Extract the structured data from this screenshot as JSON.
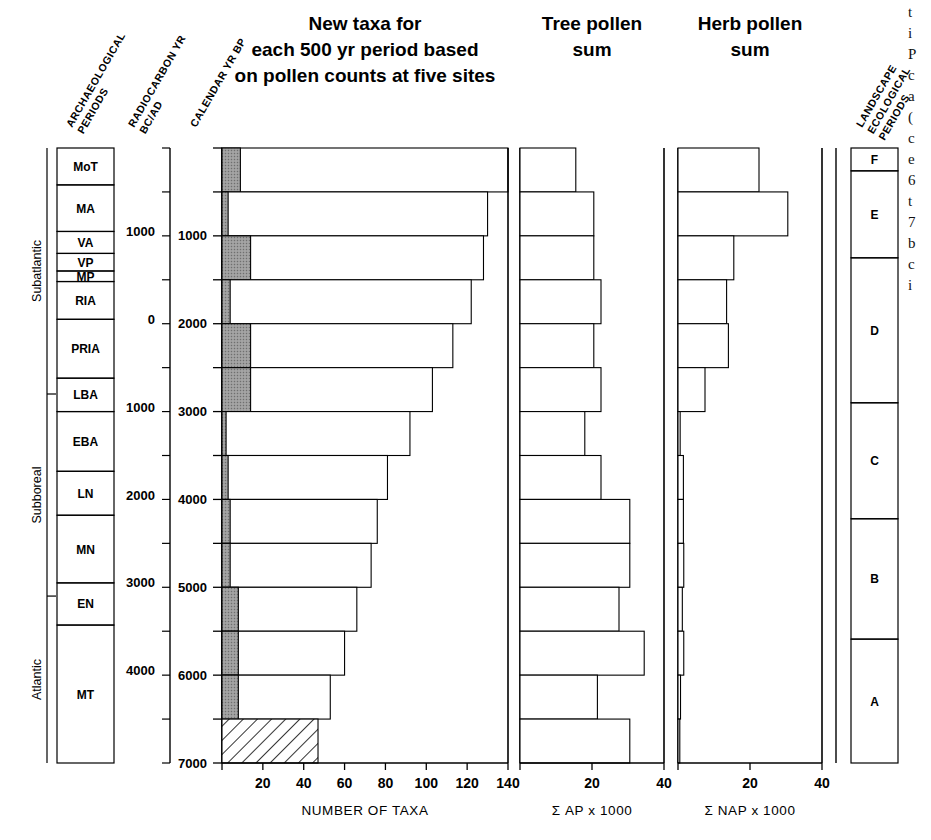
{
  "figure": {
    "titles": {
      "main": [
        "New taxa for",
        "each 500 yr period based",
        "on pollen counts at five sites"
      ],
      "tree": [
        "Tree pollen",
        "sum"
      ],
      "herb": [
        "Herb pollen",
        "sum"
      ]
    },
    "column_headers": {
      "archaeological": [
        "ARCHAEOLOGICAL",
        "PERIODS"
      ],
      "radiocarbon": [
        "RADIOCARBON YR",
        "BC/AD"
      ],
      "calendar": [
        "CALENDAR YR BP"
      ],
      "landscape": [
        "LANDSCAPE",
        "ECOLOGICAL",
        "PERIODS"
      ]
    },
    "axis_labels": {
      "taxa": "NUMBER OF TAXA",
      "tree": "Σ AP x 1000",
      "herb": "Σ NAP x 1000"
    }
  },
  "chronozones": [
    {
      "label": "Subatlantic",
      "bp_start": 0,
      "bp_end": 2800
    },
    {
      "label": "Subboreal",
      "bp_start": 2800,
      "bp_end": 5100
    },
    {
      "label": "Atlantic",
      "bp_start": 5100,
      "bp_end": 7000
    }
  ],
  "archaeological_periods": [
    {
      "label": "MoT",
      "bp_start": 0,
      "bp_end": 420
    },
    {
      "label": "MA",
      "bp_start": 420,
      "bp_end": 950
    },
    {
      "label": "VA",
      "bp_start": 950,
      "bp_end": 1200
    },
    {
      "label": "VP",
      "bp_start": 1200,
      "bp_end": 1400
    },
    {
      "label": "MP",
      "bp_start": 1400,
      "bp_end": 1520
    },
    {
      "label": "RIA",
      "bp_start": 1520,
      "bp_end": 1950
    },
    {
      "label": "PRIA",
      "bp_start": 1950,
      "bp_end": 2620
    },
    {
      "label": "LBA",
      "bp_start": 2620,
      "bp_end": 3000
    },
    {
      "label": "EBA",
      "bp_start": 3000,
      "bp_end": 3680
    },
    {
      "label": "LN",
      "bp_start": 3680,
      "bp_end": 4180
    },
    {
      "label": "MN",
      "bp_start": 4180,
      "bp_end": 4950
    },
    {
      "label": "EN",
      "bp_start": 4950,
      "bp_end": 5430
    },
    {
      "label": "MT",
      "bp_start": 5430,
      "bp_end": 7000
    }
  ],
  "landscape_periods": [
    {
      "label": "F",
      "bp_start": 0,
      "bp_end": 260
    },
    {
      "label": "E",
      "bp_start": 260,
      "bp_end": 1250
    },
    {
      "label": "D",
      "bp_start": 1250,
      "bp_end": 2900
    },
    {
      "label": "C",
      "bp_start": 2900,
      "bp_end": 4220
    },
    {
      "label": "B",
      "bp_start": 4220,
      "bp_end": 5590
    },
    {
      "label": "A",
      "bp_start": 5590,
      "bp_end": 7000
    }
  ],
  "calendar_axis": {
    "label": "CALENDAR YR BP",
    "ticks": [
      0,
      500,
      1000,
      1500,
      2000,
      2500,
      3000,
      3500,
      4000,
      4500,
      5000,
      5500,
      6000,
      6500,
      7000
    ],
    "labeled_ticks": [
      1000,
      2000,
      3000,
      4000,
      5000,
      6000,
      7000
    ],
    "min": 0,
    "max": 7000
  },
  "radiocarbon_axis": {
    "label": "RADIOCARBON YR BC/AD",
    "labeled": [
      {
        "text": "1000",
        "bp": 950
      },
      {
        "text": "0",
        "bp": 1950
      },
      {
        "text": "1000",
        "bp": 2950
      },
      {
        "text": "2000",
        "bp": 3950
      },
      {
        "text": "3000",
        "bp": 4950
      },
      {
        "text": "4000",
        "bp": 5950
      }
    ]
  },
  "chart_data": [
    {
      "type": "bar",
      "title": "New taxa for each 500 yr period based on pollen counts at five sites",
      "xlabel": "NUMBER OF TAXA",
      "ylabel": "CALENDAR YR BP",
      "orientation": "horizontal",
      "xlim": [
        0,
        140
      ],
      "xticks": [
        0,
        20,
        40,
        60,
        80,
        100,
        120,
        140
      ],
      "ylim": [
        0,
        7000
      ],
      "grid": false,
      "categories": [
        "0-500",
        "500-1000",
        "1000-1500",
        "1500-2000",
        "2000-2500",
        "2500-3000",
        "3000-3500",
        "3500-4000",
        "4000-4500",
        "4500-5000",
        "5000-5500",
        "5500-6000",
        "6000-6500",
        "6500-7000"
      ],
      "series": [
        {
          "name": "new taxa total",
          "values": [
            140,
            130,
            128,
            122,
            113,
            103,
            92,
            81,
            76,
            73,
            66,
            60,
            53,
            47
          ]
        },
        {
          "name": "shaded portion",
          "values": [
            9,
            3,
            14,
            4,
            14,
            14,
            2,
            3,
            4,
            4,
            8,
            8,
            8,
            0
          ]
        }
      ],
      "hatched_bar_index": 13,
      "notes": "lowest bar (6500-7000 BP) drawn with diagonal hatching"
    },
    {
      "type": "bar",
      "title": "Tree pollen sum",
      "xlabel": "Σ AP x 1000",
      "orientation": "horizontal",
      "xlim": [
        0,
        40
      ],
      "xticks": [
        0,
        20,
        40
      ],
      "grid": false,
      "categories": [
        "0-500",
        "500-1000",
        "1000-1500",
        "1500-2000",
        "2000-2500",
        "2500-3000",
        "3000-3500",
        "3500-4000",
        "4000-4500",
        "4500-5000",
        "5000-5500",
        "5500-6000",
        "6000-6500",
        "6500-7000"
      ],
      "values": [
        15.5,
        20.5,
        20.5,
        22.5,
        20.5,
        22.5,
        18.0,
        22.5,
        30.5,
        30.5,
        27.5,
        34.5,
        21.5,
        30.5
      ]
    },
    {
      "type": "bar",
      "title": "Herb pollen sum",
      "xlabel": "Σ NAP x 1000",
      "orientation": "horizontal",
      "xlim": [
        0,
        40
      ],
      "xticks": [
        0,
        20,
        40
      ],
      "grid": false,
      "categories": [
        "0-500",
        "500-1000",
        "1000-1500",
        "1500-2000",
        "2000-2500",
        "2500-3000",
        "3000-3500",
        "3500-4000",
        "4000-4500",
        "4500-5000",
        "5000-5500",
        "5500-6000",
        "6000-6500",
        "6500-7000"
      ],
      "values": [
        22.5,
        30.5,
        15.5,
        13.5,
        14.0,
        7.5,
        0.6,
        1.5,
        1.5,
        1.6,
        1.2,
        1.6,
        0.7,
        0.5
      ]
    }
  ],
  "caption_fragment": [
    "t",
    "i",
    "P",
    "c",
    "a",
    "(",
    "c",
    "e",
    "6",
    "t",
    "7",
    "b",
    "c",
    "i"
  ],
  "colors": {
    "shaded_fill": "#8f8f8f",
    "bar_stroke": "#000000",
    "background": "#ffffff"
  }
}
